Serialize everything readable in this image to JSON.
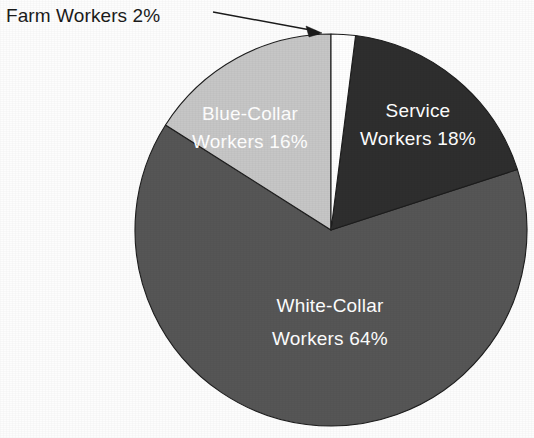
{
  "chart_data": {
    "type": "pie",
    "title": "",
    "subtitle": "",
    "xlabel": "",
    "ylabel": "",
    "legend_position": "none",
    "grid": false,
    "units": "percent",
    "total": 100,
    "categories": [
      "Farm Workers",
      "Service Workers",
      "White-Collar Workers",
      "Blue-Collar Workers"
    ],
    "values": [
      2,
      18,
      64,
      16
    ],
    "slices": [
      {
        "name": "Farm Workers",
        "value": 2,
        "value_text": "2%",
        "label_line1": "Farm Workers 2%",
        "label_line2": "",
        "label_placement": "outside-callout",
        "color": "#ffffff",
        "text_color": "#1b1b1b",
        "start_pct": 0,
        "end_pct": 2
      },
      {
        "name": "Service Workers",
        "value": 18,
        "value_text": "18%",
        "label_line1": "Service",
        "label_line2": "Workers 18%",
        "label_placement": "inside",
        "color": "#2e2e2e",
        "text_color": "#ffffff",
        "start_pct": 2,
        "end_pct": 20
      },
      {
        "name": "White-Collar Workers",
        "value": 64,
        "value_text": "64%",
        "label_line1": "White-Collar",
        "label_line2": "Workers 64%",
        "label_placement": "inside",
        "color": "#565656",
        "text_color": "#ffffff",
        "start_pct": 20,
        "end_pct": 84
      },
      {
        "name": "Blue-Collar Workers",
        "value": 16,
        "value_text": "16%",
        "label_line1": "Blue-Collar",
        "label_line2": "Workers 16%",
        "label_placement": "inside",
        "color": "#c6c6c6",
        "text_color": "#ffffff",
        "start_pct": 84,
        "end_pct": 100
      }
    ]
  },
  "callout": {
    "text": "Farm Workers 2%",
    "target_slice": "Farm Workers"
  },
  "labels": {
    "service_line1": "Service",
    "service_line2": "Workers 18%",
    "white_collar_line1": "White-Collar",
    "white_collar_line2": "Workers 64%",
    "blue_collar_line1": "Blue-Collar",
    "blue_collar_line2": "Workers 16%",
    "farm_callout": "Farm Workers 2%"
  },
  "colors": {
    "background": "#fdfdfd",
    "outline": "#1d1d1d",
    "farm": "#ffffff",
    "service": "#2e2e2e",
    "white_collar": "#565656",
    "blue_collar": "#c6c6c6",
    "callout_text": "#1b1b1b",
    "inside_text": "#ffffff"
  }
}
